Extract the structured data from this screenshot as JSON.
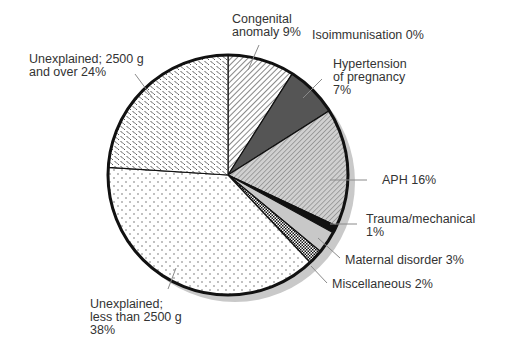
{
  "chart_data": {
    "type": "pie",
    "title": "",
    "start_angle_deg": 0,
    "direction": "clockwise",
    "shadow": true,
    "slices": [
      {
        "label": "Congenital anomaly",
        "value": 9,
        "display": [
          "Congenital",
          "anomaly 9%"
        ],
        "fill": "diag-fine",
        "color": "#ffffff"
      },
      {
        "label": "Isoimmunisation",
        "value": 0,
        "display": [
          "Isoimmunisation 0%"
        ],
        "fill": "none",
        "color": "#ffffff"
      },
      {
        "label": "Hypertension of pregnancy",
        "value": 7,
        "display": [
          "Hypertension",
          "of pregnancy",
          "7%"
        ],
        "fill": "dark",
        "color": "#555555"
      },
      {
        "label": "APH",
        "value": 16,
        "display": [
          "APH 16%"
        ],
        "fill": "diag-grey",
        "color": "#b8b8b8"
      },
      {
        "label": "Trauma/mechanical",
        "value": 1,
        "display": [
          "Trauma/mechanical",
          "1%"
        ],
        "fill": "black",
        "color": "#111111"
      },
      {
        "label": "Maternal disorder",
        "value": 3,
        "display": [
          "Maternal disorder 3%"
        ],
        "fill": "light-grey",
        "color": "#c8c8c8"
      },
      {
        "label": "Miscellaneous",
        "value": 2,
        "display": [
          "Miscellaneous 2%"
        ],
        "fill": "checker",
        "color": "#888888"
      },
      {
        "label": "Unexplained; less than 2500g",
        "value": 38,
        "display": [
          "Unexplained;",
          "less than 2500 g",
          "38%"
        ],
        "fill": "dots",
        "color": "#ffffff"
      },
      {
        "label": "Unexplained; 2500g and over",
        "value": 24,
        "display": [
          "Unexplained; 2500 g",
          "and over 24%"
        ],
        "fill": "dash",
        "color": "#ffffff"
      }
    ],
    "legend": "none (direct labels with leader lines)"
  }
}
